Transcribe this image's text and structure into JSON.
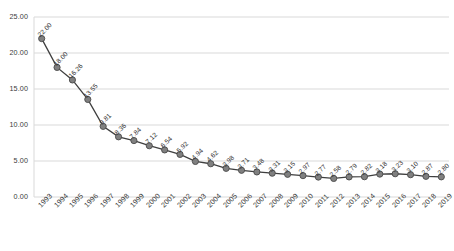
{
  "chart_data": {
    "type": "line",
    "title": "",
    "subtitle": "",
    "xlabel": "",
    "ylabel": "",
    "categories": [
      "1993",
      "1994",
      "1995",
      "1996",
      "1997",
      "1998",
      "1999",
      "2000",
      "2001",
      "2002",
      "2003",
      "2004",
      "2005",
      "2006",
      "2007",
      "2008",
      "2009",
      "2010",
      "2011",
      "2012",
      "2013",
      "2014",
      "2015",
      "2016",
      "2017",
      "2018",
      "2019"
    ],
    "values": [
      22.0,
      18.0,
      16.26,
      13.55,
      9.81,
      8.36,
      7.84,
      7.12,
      6.54,
      5.92,
      4.94,
      4.62,
      3.98,
      3.71,
      3.48,
      3.31,
      3.15,
      2.97,
      2.77,
      2.58,
      2.79,
      2.82,
      3.18,
      3.23,
      3.1,
      2.87,
      2.8
    ],
    "point_labels": [
      "22.00",
      "18.00",
      "16.26",
      "13.55",
      "9.81",
      "8.36",
      "7.84",
      "7.12",
      "6.54",
      "5.92",
      "4.94",
      "4.62",
      "3.98",
      "3.71",
      "3.48",
      "3.31",
      "3.15",
      "2.97",
      "2.77",
      "2.58",
      "2.79",
      "2.82",
      "3.18",
      "3.23",
      "3.10",
      "2.87",
      "2.80"
    ],
    "ylim": [
      0,
      25
    ],
    "yticks": [
      0,
      5,
      10,
      15,
      20,
      25
    ],
    "ytick_labels": [
      "0.00",
      "5.00",
      "10.00",
      "15.00",
      "20.00",
      "25.00"
    ],
    "grid": true,
    "grid_axis": "y",
    "legend": "none",
    "series_name": "",
    "colors": {
      "line": "#3f3f3f",
      "marker_fill": "#808080",
      "marker_stroke": "#4a4a4a",
      "gridline": "#d9d9d9",
      "axis_text": "#3b3b3b",
      "label_text": "#2f2f2f",
      "background": "#ffffff"
    }
  }
}
